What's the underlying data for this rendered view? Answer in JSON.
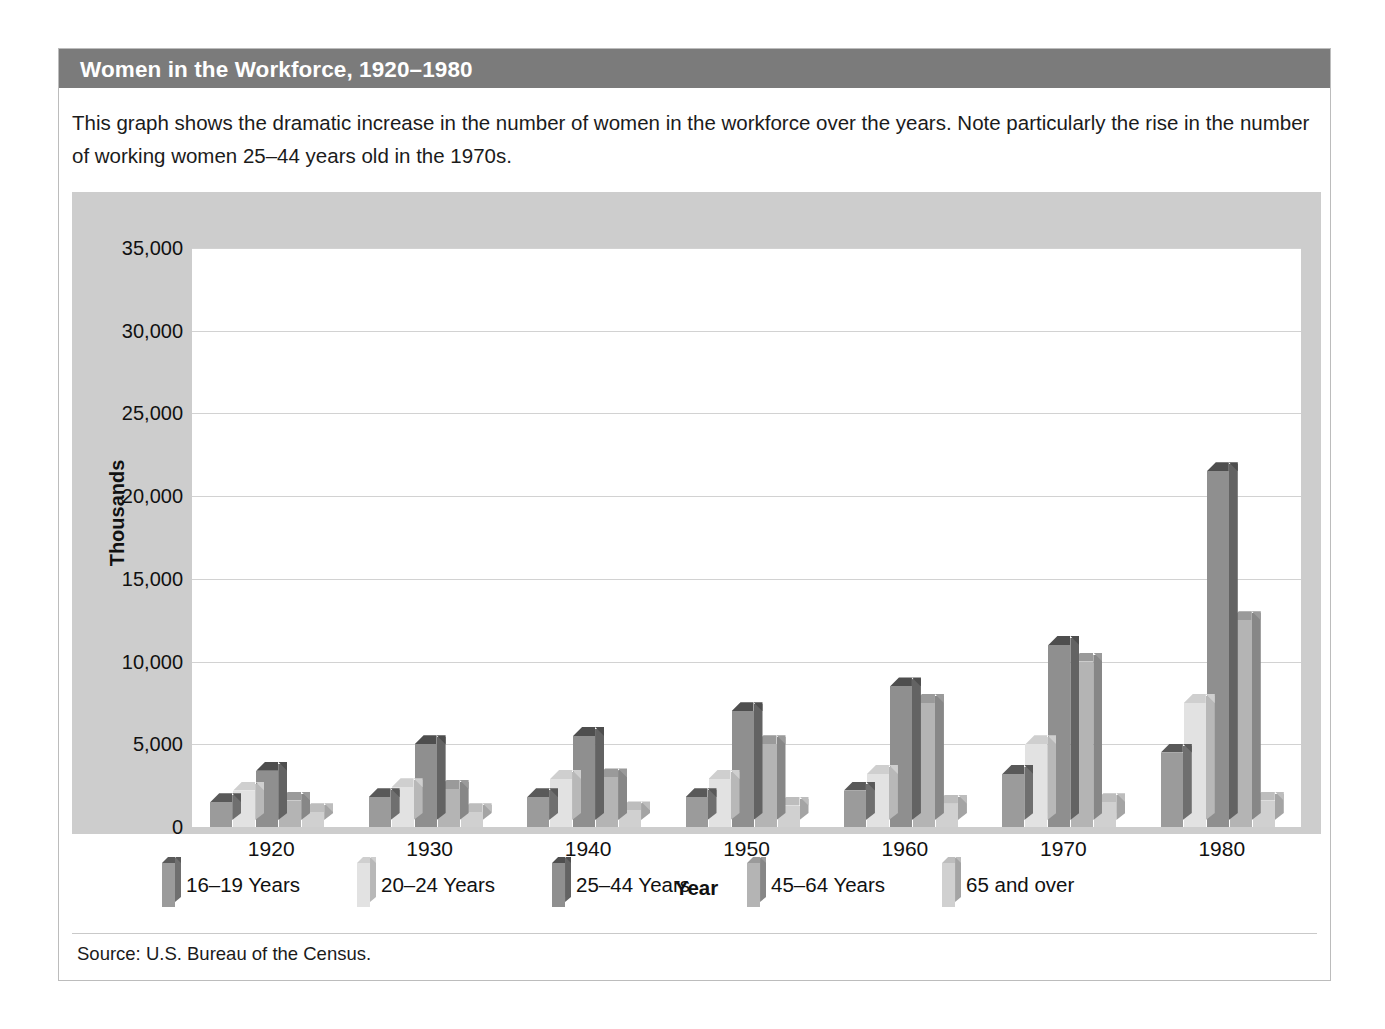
{
  "title": "Women in the Workforce, 1920–1980",
  "caption": "This graph shows the dramatic increase in the number of women in the workforce over the years. Note particularly the rise in the number of working women 25–44 years old in the 1970s.",
  "source": "Source: U.S. Bureau of the Census.",
  "colors": {
    "title_bar": "#7b7b7b",
    "panel": "#cdcdcd",
    "plot": "#ffffff",
    "gridline": "#d2d2d2",
    "series": [
      "#9b9b9b",
      "#e2e2e2",
      "#8f8f8f",
      "#b4b4b4",
      "#d0d0d0"
    ],
    "series_side": [
      "#6f6f6f",
      "#b8b8b8",
      "#636363",
      "#878787",
      "#a4a4a4"
    ],
    "series_top": [
      "#595959",
      "#cfcfcf",
      "#4e4e4e",
      "#9a9a9a",
      "#bdbdbd"
    ]
  },
  "chart_data": {
    "type": "bar",
    "title": "Women in the Workforce, 1920–1980",
    "xlabel": "Year",
    "ylabel": "Thousands",
    "categories": [
      "1920",
      "1930",
      "1940",
      "1950",
      "1960",
      "1970",
      "1980"
    ],
    "ytick_labels": [
      "0",
      "5,000",
      "10,000",
      "15,000",
      "20,000",
      "25,000",
      "30,000",
      "35,000"
    ],
    "yticks": [
      0,
      5000,
      10000,
      15000,
      20000,
      25000,
      30000,
      35000
    ],
    "ylim": [
      0,
      35000
    ],
    "grid": true,
    "legend_position": "below-plot",
    "series": [
      {
        "name": "16–19 Years",
        "values": [
          1500,
          1800,
          1800,
          1800,
          2200,
          3200,
          4500
        ]
      },
      {
        "name": "20–24 Years",
        "values": [
          2200,
          2400,
          2900,
          2900,
          3200,
          5000,
          7500
        ]
      },
      {
        "name": "25–44 Years",
        "values": [
          3400,
          5000,
          5500,
          7000,
          8500,
          11000,
          21500
        ]
      },
      {
        "name": "45–64 Years",
        "values": [
          1600,
          2300,
          3000,
          5000,
          7500,
          10000,
          12500
        ]
      },
      {
        "name": "65 and over",
        "values": [
          900,
          900,
          1000,
          1300,
          1400,
          1500,
          1600
        ]
      }
    ]
  }
}
